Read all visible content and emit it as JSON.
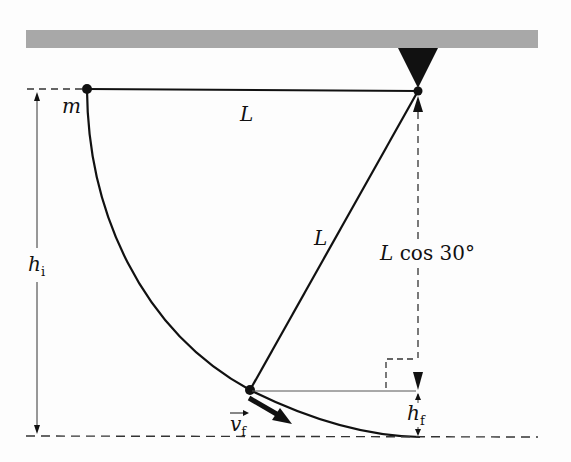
{
  "diagram": {
    "labels": {
      "mass": "m",
      "length_top": "L",
      "length_diag": "L",
      "lcos_L": "L",
      "lcos_rest": "cos 30°",
      "h_initial_main": "h",
      "h_initial_sub": "i",
      "h_final_main": "h",
      "h_final_sub": "f",
      "velocity_main": "v",
      "velocity_sub": "f"
    },
    "colors": {
      "ceiling": "#a8a8a8",
      "line": "#111111",
      "dashed": "#333333"
    }
  }
}
